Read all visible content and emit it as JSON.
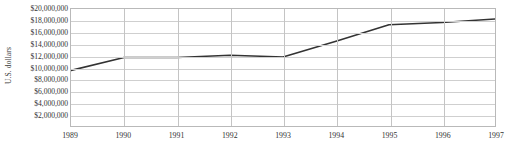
{
  "chart_data": {
    "type": "line",
    "title": "",
    "subtitle": "",
    "xlabel": "",
    "ylabel": "U.S. dollars",
    "x": [
      1989,
      1990,
      1991,
      1992,
      1993,
      1994,
      1995,
      1996,
      1997
    ],
    "categories": [
      "1989",
      "1990",
      "1991",
      "1992",
      "1993",
      "1994",
      "1995",
      "1996",
      "1997"
    ],
    "values": [
      9500000,
      11700000,
      11700000,
      12100000,
      11800000,
      14500000,
      17300000,
      17700000,
      18300000
    ],
    "series": [
      {
        "name": "U.S. dollars",
        "color": "#333333",
        "values": [
          9500000,
          11700000,
          11700000,
          12100000,
          11800000,
          14500000,
          17300000,
          17700000,
          18300000
        ]
      }
    ],
    "xlim": [
      1989,
      1997
    ],
    "ylim": [
      0,
      20000000
    ],
    "ytick_values": [
      2000000,
      4000000,
      6000000,
      8000000,
      10000000,
      12000000,
      14000000,
      16000000,
      18000000,
      20000000
    ],
    "ytick_labels": [
      "$2,000,000",
      "$4,000,000",
      "$6,000,000",
      "$8,000,000",
      "$10,000,000",
      "$12,000,000",
      "$14,000,000",
      "$16,000,000",
      "$18,000,000",
      "$20,000,000"
    ],
    "xtick_labels": [
      "1989",
      "1990",
      "1991",
      "1992",
      "1993",
      "1994",
      "1995",
      "1996",
      "1997"
    ],
    "grid": {
      "horizontal": true,
      "vertical": true,
      "horizontal_color": "#cfcfcf",
      "vertical_color": "#c4c4c4"
    },
    "legend": {
      "visible": false,
      "position": "none",
      "entries": []
    },
    "annotations": [],
    "plot_border_color": "#b9b9b9",
    "background_color": "#ffffff"
  }
}
